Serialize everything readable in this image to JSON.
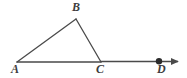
{
  "figure": {
    "kind": "geometry-diagram",
    "background_color": "#ffffff",
    "stroke_color": "#4a4a4a",
    "label_color": "#3d3d3d",
    "stroke_width": 1.3,
    "canvas": {
      "width": 187,
      "height": 78
    },
    "points": {
      "A": {
        "label": "A",
        "x": 17,
        "y": 62
      },
      "B": {
        "label": "B",
        "x": 76,
        "y": 19
      },
      "C": {
        "label": "C",
        "x": 101,
        "y": 62
      },
      "D": {
        "label": "D",
        "x": 159,
        "y": 61
      }
    },
    "segments": [
      {
        "name": "segment-AB",
        "from": "A",
        "to": "B"
      },
      {
        "name": "segment-BC",
        "from": "B",
        "to": "C"
      },
      {
        "name": "segment-AC",
        "from": "A",
        "to": "C"
      },
      {
        "name": "ray-CD",
        "from": "C",
        "to": "D"
      }
    ],
    "ray": {
      "name": "ray-to-arrow",
      "from_x": 101,
      "to_x": 180,
      "y": 61,
      "arrowhead": true
    },
    "marked_points": [
      {
        "name": "point-D-dot",
        "x": 159,
        "y": 61,
        "radius": 3.2
      }
    ],
    "labels": [
      {
        "id": "A",
        "text": "A"
      },
      {
        "id": "B",
        "text": "B"
      },
      {
        "id": "C",
        "text": "C"
      },
      {
        "id": "D",
        "text": "D"
      }
    ]
  }
}
